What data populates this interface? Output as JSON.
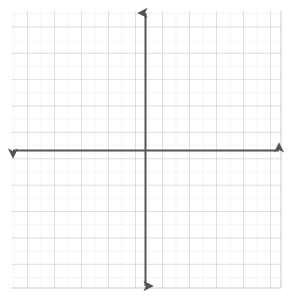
{
  "figure": {
    "title": "",
    "background_color": "#ffffff",
    "width": 291,
    "height": 298
  },
  "chart_data": {
    "type": "scatter",
    "title": "",
    "subtitle": "",
    "xlabel": "",
    "ylabel": "",
    "series": [],
    "x": [],
    "values": [],
    "annotations": [],
    "legend": {
      "visible": false,
      "position": "none",
      "entries": []
    },
    "grid": {
      "visible": true,
      "minor_visible": true,
      "minor_color": "#ebebeb",
      "major_color": "#c9c9c9",
      "minor_step": 1,
      "major_step": 2,
      "minor_spacing_px": 13.5,
      "major_spacing_px": 27.0
    },
    "xlim": [
      -10,
      10
    ],
    "ylim": [
      -10.3,
      10.3
    ],
    "xticks": [
      -10,
      -9,
      -8,
      -7,
      -6,
      -5,
      -4,
      -3,
      -2,
      -1,
      0,
      1,
      2,
      3,
      4,
      5,
      6,
      7,
      8,
      9,
      10
    ],
    "yticks": [
      -10,
      -9,
      -8,
      -7,
      -6,
      -5,
      -4,
      -3,
      -2,
      -1,
      0,
      1,
      2,
      3,
      4,
      5,
      6,
      7,
      8,
      9,
      10
    ],
    "xtick_labels": [],
    "ytick_labels": [],
    "tick_marks_visible": false,
    "axis_labels_visible": false
  },
  "axes": {
    "color": "#555555",
    "stroke_width": 2,
    "arrowheads": true,
    "x_axis": {
      "name": "x-axis",
      "orientation": "horizontal",
      "start_px": 11,
      "end_px": 281,
      "position_px": 150.5,
      "arrow_start": true,
      "arrow_end": true
    },
    "y_axis": {
      "name": "y-axis",
      "orientation": "vertical",
      "start_px": 11,
      "end_px": 288,
      "position_px": 145.5,
      "arrow_start": true,
      "arrow_end": true
    },
    "origin": {
      "label": "",
      "x_px": 145.5,
      "y_px": 150.5
    }
  },
  "plot_area": {
    "left_px": 11,
    "top_px": 11,
    "right_px": 281,
    "bottom_px": 288,
    "width_px": 270,
    "height_px": 277,
    "border_visible": false,
    "fill_color": "#ffffff"
  }
}
